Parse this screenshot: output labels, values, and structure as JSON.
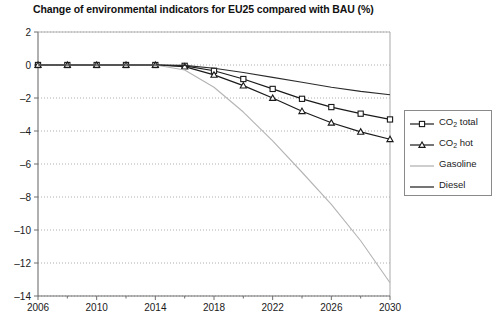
{
  "chart_data": {
    "type": "line",
    "title": "Change of environmental indicators for EU25 compared with BAU (%)",
    "xlabel": "",
    "ylabel": "",
    "xlim": [
      2006,
      2030
    ],
    "ylim": [
      -14,
      2
    ],
    "yticks": [
      2,
      0,
      -2,
      -4,
      -6,
      -8,
      -10,
      -12,
      -14
    ],
    "xticks": [
      2006,
      2010,
      2014,
      2018,
      2022,
      2026,
      2030
    ],
    "grid": true,
    "legend_position": "right",
    "x": [
      2006,
      2008,
      2010,
      2012,
      2014,
      2016,
      2018,
      2020,
      2022,
      2024,
      2026,
      2028,
      2030
    ],
    "series": [
      {
        "name": "CO2 total",
        "label": "CO₂ total",
        "marker": "square",
        "color": "#1a1a1a",
        "values": [
          0,
          0,
          0,
          0,
          0,
          -0.05,
          -0.35,
          -0.85,
          -1.45,
          -2.05,
          -2.55,
          -2.95,
          -3.3
        ]
      },
      {
        "name": "CO2 hot",
        "label": "CO₂ hot",
        "marker": "triangle",
        "color": "#1a1a1a",
        "values": [
          0,
          0,
          0,
          0,
          0,
          -0.1,
          -0.6,
          -1.25,
          -2.0,
          -2.8,
          -3.5,
          -4.05,
          -4.5
        ]
      },
      {
        "name": "Gasoline",
        "label": "Gasoline",
        "marker": "none",
        "color": "#b4b4b4",
        "values": [
          0,
          0,
          0,
          0,
          0,
          -0.3,
          -1.35,
          -2.85,
          -4.6,
          -6.5,
          -8.45,
          -10.65,
          -13.2
        ]
      },
      {
        "name": "Diesel",
        "label": "Diesel",
        "marker": "none",
        "color": "#2b2b2b",
        "values": [
          0,
          0,
          0,
          0,
          0,
          -0.02,
          -0.2,
          -0.45,
          -0.75,
          -1.05,
          -1.35,
          -1.6,
          -1.8
        ]
      }
    ]
  },
  "legend": {
    "items": [
      {
        "label_main": "CO",
        "label_sub": "2",
        "label_tail": " total",
        "marker": "square"
      },
      {
        "label_main": "CO",
        "label_sub": "2",
        "label_tail": " hot",
        "marker": "triangle"
      },
      {
        "label_main": "Gasoline",
        "label_sub": "",
        "label_tail": "",
        "marker": "none"
      },
      {
        "label_main": "Diesel",
        "label_sub": "",
        "label_tail": "",
        "marker": "none"
      }
    ]
  },
  "colors": {
    "axis": "#6e6e6e",
    "grid": "#9a9a9a",
    "gasoline": "#b4b4b4",
    "diesel": "#2b2b2b",
    "co2": "#1a1a1a"
  }
}
